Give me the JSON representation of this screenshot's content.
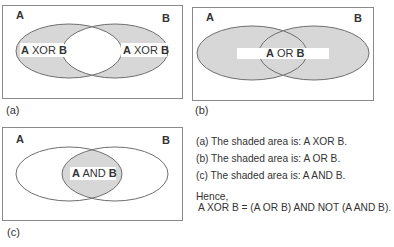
{
  "colors": {
    "shade": "#d7d7d7",
    "outline": "#6f6f6f",
    "box": "#8a8a8a",
    "text": "#222222",
    "label_bg": "#ffffff"
  },
  "panels": [
    {
      "id": "a",
      "caption": "(a)",
      "set_a_label": "A",
      "set_b_label": "B",
      "shaded_region": "A XOR B",
      "region_labels": [
        {
          "bold1": "A",
          "op": " XOR ",
          "bold2": "B"
        },
        {
          "bold1": "A",
          "op": " XOR ",
          "bold2": "B"
        }
      ]
    },
    {
      "id": "b",
      "caption": "(b)",
      "set_a_label": "A",
      "set_b_label": "B",
      "shaded_region": "A OR B",
      "region_labels": [
        {
          "bold1": "A",
          "op": " OR ",
          "bold2": "B"
        }
      ]
    },
    {
      "id": "c",
      "caption": "(c)",
      "set_a_label": "A",
      "set_b_label": "B",
      "shaded_region": "A AND B",
      "region_labels": [
        {
          "bold1": "A",
          "op": " AND ",
          "bold2": "B"
        }
      ]
    }
  ],
  "notes": {
    "line_a": "(a) The shaded area is: A XOR B.",
    "line_b": "(b) The shaded area is: A OR B.",
    "line_c": "(c) The shaded area is: A AND B.",
    "hence": "Hence,",
    "conclusion": "A XOR B = (A OR B) AND NOT (A AND B)."
  }
}
